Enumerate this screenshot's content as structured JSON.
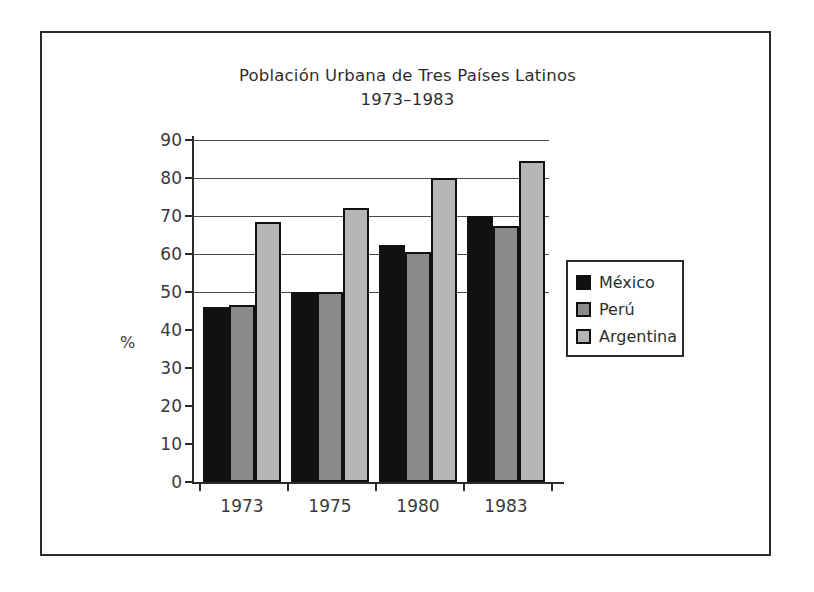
{
  "chart_data": {
    "type": "bar",
    "title": "Población Urbana de Tres Países Latinos",
    "subtitle": "1973–1983",
    "xlabel": "",
    "ylabel": "%",
    "categories": [
      "1973",
      "1975",
      "1980",
      "1983"
    ],
    "series": [
      {
        "name": "México",
        "color": "#111111",
        "values": [
          46,
          50,
          62.5,
          70
        ]
      },
      {
        "name": "Perú",
        "color": "#8a8a8a",
        "values": [
          46.5,
          50,
          60.5,
          67.5
        ]
      },
      {
        "name": "Argentina",
        "color": "#b5b5b5",
        "values": [
          68.5,
          72,
          80,
          84.5
        ]
      }
    ],
    "ylim": [
      0,
      90
    ],
    "ytick_values": [
      0,
      10,
      20,
      30,
      40,
      50,
      60,
      70,
      80,
      90
    ],
    "ytick_labels": [
      "0",
      "10",
      "20",
      "30",
      "40",
      "50",
      "60",
      "70",
      "80",
      "90"
    ],
    "gridlines_at": [
      50,
      60,
      70,
      80,
      90
    ],
    "grid": true,
    "legend_position": "right"
  },
  "figure": {
    "title_line1": "Población Urbana de Tres Países Latinos",
    "title_line2": "1973–1983",
    "y_axis_title": "%"
  }
}
